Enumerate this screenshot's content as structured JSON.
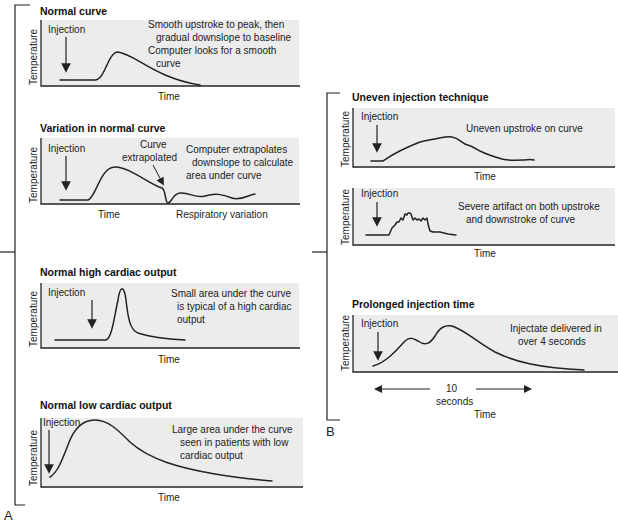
{
  "figure": {
    "group_a_label": "A",
    "group_b_label": "B",
    "y_axis_label": "Temperature",
    "x_axis_label": "Time",
    "injection_label": "Injection"
  },
  "panels_a": [
    {
      "title": "Normal curve",
      "notes": [
        "Smooth upstroke to peak, then",
        "gradual downslope to baseline",
        "Computer looks for a smooth",
        "curve"
      ]
    },
    {
      "title": "Variation in normal curve",
      "callout": [
        "Curve",
        "extrapolated"
      ],
      "notes": [
        "Computer extrapolates",
        "downslope to calculate",
        "area under curve"
      ],
      "extra_x_label": "Respiratory variation"
    },
    {
      "title": "Normal high cardiac output",
      "notes": [
        "Small area under the curve",
        "is typical of a high cardiac",
        "output"
      ]
    },
    {
      "title": "Normal low cardiac output",
      "notes": [
        "Large area under the curve",
        "seen in patients with low",
        "cardiac output"
      ]
    }
  ],
  "panels_b": [
    {
      "title": "Uneven injection technique",
      "notes": [
        "Uneven upstroke on curve"
      ]
    },
    {
      "title": "",
      "notes": [
        "Severe artifact on both upstroke",
        "and downstroke of curve"
      ]
    },
    {
      "title": "Prolonged injection time",
      "notes": [
        "Injectate delivered in",
        "over 4 seconds"
      ],
      "duration_value": "10",
      "duration_unit": "seconds"
    }
  ]
}
